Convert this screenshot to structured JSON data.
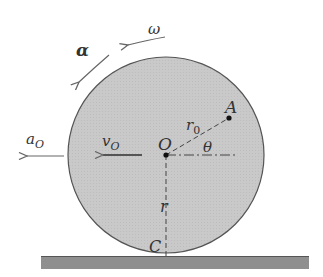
{
  "figure": {
    "type": "rolling-wheel-kinematics",
    "labels": {
      "omega": "ω",
      "alpha": "α",
      "a_O": "a",
      "a_O_sub": "O",
      "v_O": "v",
      "v_O_sub": "O",
      "center": "O",
      "point_A": "A",
      "r0": "r",
      "r0_sub": "0",
      "theta": "θ",
      "radius": "r",
      "contact": "C"
    },
    "colors": {
      "wheel_fill": "#c8c8c8",
      "wheel_stroke": "#555555",
      "ground": "#8f8f8f",
      "arrow": "#666666",
      "text": "#333333"
    }
  }
}
